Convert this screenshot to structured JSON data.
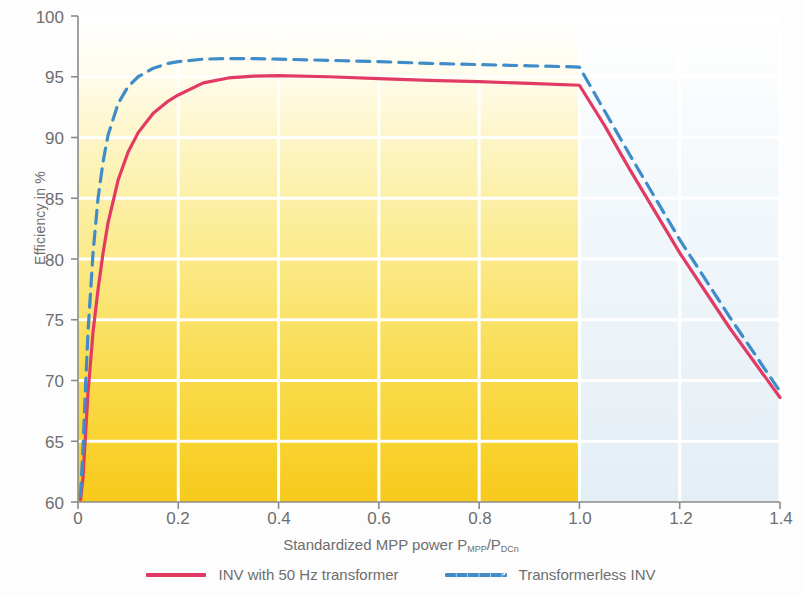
{
  "chart_data": {
    "type": "line",
    "title": "",
    "xlabel": "Standardized MPP power P_MPP/P_DCn",
    "xlabel_main": "Standardized MPP power P",
    "xlabel_sub1": "MPP",
    "xlabel_mid": "/P",
    "xlabel_sub2": "DCn",
    "ylabel": "Efficiency in %",
    "xlim": [
      0,
      1.4
    ],
    "ylim": [
      60,
      100
    ],
    "xticks": [
      "0",
      "0.2",
      "0.4",
      "0.6",
      "0.8",
      "1.0",
      "1.2",
      "1.4"
    ],
    "xtick_values": [
      0,
      0.2,
      0.4,
      0.6,
      0.8,
      1.0,
      1.2,
      1.4
    ],
    "yticks": [
      "60",
      "65",
      "70",
      "75",
      "80",
      "85",
      "90",
      "95",
      "100"
    ],
    "ytick_values": [
      60,
      65,
      70,
      75,
      80,
      85,
      90,
      95,
      100
    ],
    "grid": true,
    "grid_color": "#ffffff",
    "legend_position": "bottom",
    "annotations": [
      {
        "text": "Power limitation",
        "x": 1.18,
        "y": 97.5
      }
    ],
    "regions": [
      {
        "name": "operating-region",
        "x_from": 0,
        "x_to": 1.0,
        "fill": "yellow-gradient",
        "gradient_from": "#fffdf2",
        "gradient_to": "#f9cf28"
      },
      {
        "name": "power-limitation-region",
        "x_from": 1.0,
        "x_to": 1.4,
        "fill": "#e9f1f7"
      }
    ],
    "series": [
      {
        "name": "INV with 50 Hz transformer",
        "color": "#e23b63",
        "style": "solid",
        "x": [
          0.005,
          0.01,
          0.015,
          0.02,
          0.03,
          0.04,
          0.05,
          0.06,
          0.08,
          0.1,
          0.12,
          0.15,
          0.18,
          0.2,
          0.25,
          0.3,
          0.35,
          0.4,
          0.5,
          0.6,
          0.7,
          0.8,
          0.9,
          1.0,
          1.05,
          1.1,
          1.2,
          1.3,
          1.4
        ],
        "y": [
          60.2,
          62.0,
          65.5,
          69.0,
          74.0,
          77.5,
          80.5,
          83.0,
          86.5,
          88.8,
          90.4,
          92.0,
          93.0,
          93.5,
          94.5,
          94.9,
          95.05,
          95.1,
          95.0,
          94.85,
          94.7,
          94.6,
          94.45,
          94.3,
          91.0,
          87.4,
          80.5,
          74.3,
          68.6
        ]
      },
      {
        "name": "Transformerless INV",
        "color": "#3f8cc9",
        "style": "dashed",
        "x": [
          0.005,
          0.01,
          0.015,
          0.02,
          0.03,
          0.04,
          0.05,
          0.06,
          0.08,
          0.1,
          0.12,
          0.15,
          0.18,
          0.2,
          0.25,
          0.3,
          0.35,
          0.4,
          0.5,
          0.6,
          0.7,
          0.8,
          0.9,
          1.0,
          1.05,
          1.1,
          1.2,
          1.3,
          1.4
        ],
        "y": [
          60.5,
          64.5,
          69.5,
          74.0,
          80.5,
          85.0,
          88.0,
          90.2,
          92.8,
          94.2,
          95.0,
          95.7,
          96.1,
          96.25,
          96.45,
          96.5,
          96.5,
          96.45,
          96.35,
          96.25,
          96.1,
          96.0,
          95.9,
          95.8,
          92.2,
          88.6,
          81.6,
          75.2,
          69.1
        ]
      }
    ]
  },
  "axis": {
    "y_label": "Efficiency in %",
    "x_ticks": [
      "0",
      "0.2",
      "0.4",
      "0.6",
      "0.8",
      "1.0",
      "1.2",
      "1.4"
    ],
    "y_ticks": [
      "100",
      "95",
      "90",
      "85",
      "80",
      "75",
      "70",
      "65",
      "60"
    ]
  },
  "annotation": {
    "power_limitation": "Power limitation"
  },
  "legend": {
    "items": [
      {
        "label": "INV with 50 Hz transformer",
        "color": "#e23b63",
        "style": "solid"
      },
      {
        "label": "Transformerless INV",
        "color": "#3f8cc9",
        "style": "dashed"
      }
    ]
  }
}
